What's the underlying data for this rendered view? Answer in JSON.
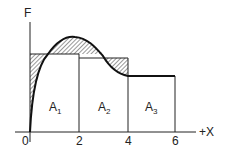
{
  "diagram": {
    "axis_y_label": "F",
    "axis_x_label": "+X",
    "ticks": [
      "0",
      "2",
      "4",
      "6"
    ],
    "areas": [
      {
        "letter": "A",
        "sub": "1"
      },
      {
        "letter": "A",
        "sub": "2"
      },
      {
        "letter": "A",
        "sub": "3"
      }
    ]
  }
}
